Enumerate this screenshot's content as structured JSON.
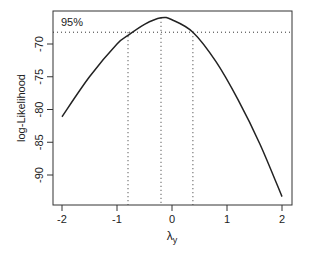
{
  "chart_data": {
    "type": "line",
    "title": "",
    "xlabel": "λ",
    "xlabel_subscript": "y",
    "ylabel": "log-Likelihood",
    "xlim": [
      -2.17,
      2.18
    ],
    "ylim": [
      -94.5,
      -64.4
    ],
    "xticks": [
      -2,
      -1,
      0,
      1,
      2
    ],
    "xtick_labels": [
      "-2",
      "-1",
      "0",
      "1",
      "2"
    ],
    "yticks": [
      -70,
      -75,
      -80,
      -85,
      -90
    ],
    "ytick_labels": [
      "-70",
      "-75",
      "-80",
      "-85",
      "-90"
    ],
    "grid": false,
    "legend": null,
    "series": [
      {
        "name": "log-Likelihood",
        "x": [
          -2.0,
          -1.5,
          -1.0,
          -0.8,
          -0.5,
          -0.2,
          0.0,
          0.38,
          0.8,
          1.2,
          1.6,
          2.0
        ],
        "values": [
          -81.1,
          -75.0,
          -70.0,
          -68.7,
          -67.0,
          -66.0,
          -66.3,
          -68.2,
          -72.7,
          -78.5,
          -85.3,
          -93.3
        ]
      }
    ],
    "annotations": {
      "ci_label": "95%",
      "ci_level_y": -68.2,
      "vertical_lines_x": [
        -0.8,
        -0.2,
        0.38
      ],
      "max_lambda": -0.2,
      "ci_lower": -0.8,
      "ci_upper": 0.38
    },
    "colors": {
      "line": "#222222",
      "axis": "#222222",
      "dotted": "#333333"
    }
  }
}
